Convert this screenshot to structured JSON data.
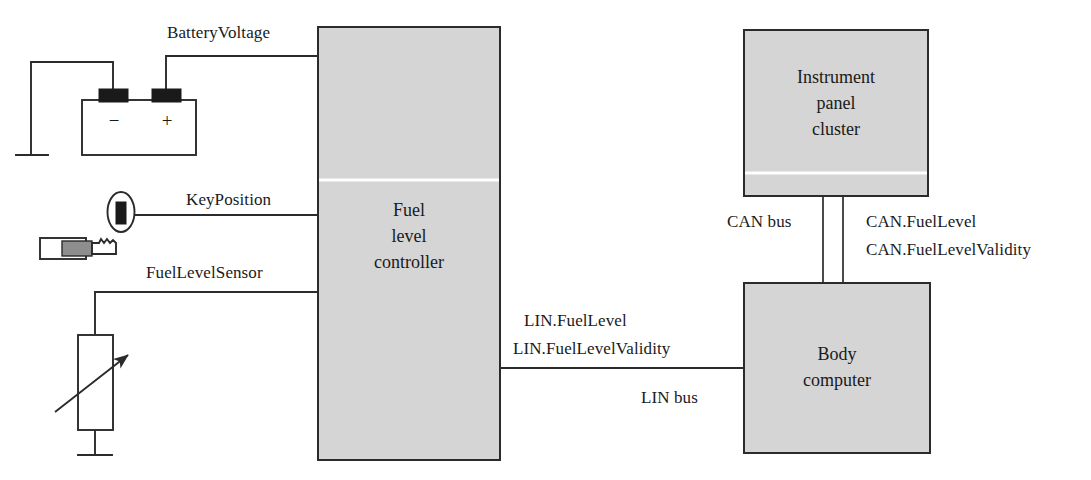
{
  "diagram": {
    "colors": {
      "block_fill": "#d5d5d5",
      "block_stroke": "#2b2b2b",
      "wire": "#2b2b2b",
      "background": "#ffffff",
      "key_grip_gray": "#8e8e8e",
      "terminal_black": "#1a1a1a"
    },
    "blocks": [
      {
        "id": "fuel-level-controller",
        "label": "Fuel\nlevel\ncontroller"
      },
      {
        "id": "instrument-panel-cluster",
        "label": "Instrument\npanel\ncluster"
      },
      {
        "id": "body-computer",
        "label": "Body\ncomputer"
      }
    ],
    "signals": [
      {
        "id": "battery-voltage",
        "label": "BatteryVoltage"
      },
      {
        "id": "key-position",
        "label": "KeyPosition"
      },
      {
        "id": "fuel-level-sensor",
        "label": "FuelLevelSensor"
      }
    ],
    "buses": [
      {
        "id": "lin-bus",
        "name": "LIN bus",
        "messages": [
          "LIN.FuelLevel",
          "LIN.FuelLevelValidity"
        ]
      },
      {
        "id": "can-bus",
        "name": "CAN bus",
        "messages": [
          "CAN.FuelLevel",
          "CAN.FuelLevelValidity"
        ]
      }
    ],
    "battery": {
      "id": "battery",
      "negative_terminal": "−",
      "positive_terminal": "+"
    },
    "symbols": [
      {
        "id": "ground-battery",
        "name": "ground-symbol"
      },
      {
        "id": "ground-sensor",
        "name": "ground-symbol"
      },
      {
        "id": "ignition-key",
        "name": "ignition-key-symbol"
      },
      {
        "id": "variable-resistor",
        "name": "variable-resistor-symbol"
      }
    ]
  }
}
